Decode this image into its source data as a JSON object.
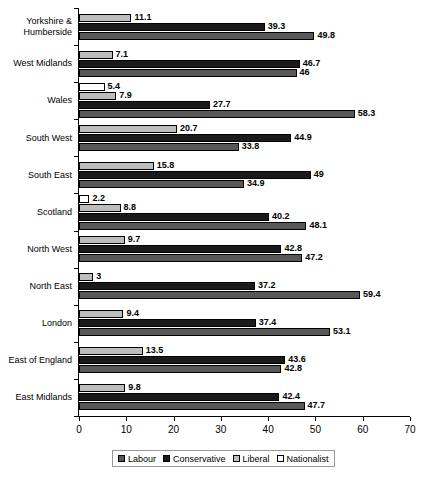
{
  "chart_data": {
    "type": "bar",
    "orientation": "horizontal",
    "title": "",
    "subtitle": "",
    "xlabel": "",
    "ylabel": "",
    "xlim": [
      0,
      70
    ],
    "xticks": [
      0,
      10,
      20,
      30,
      40,
      50,
      60,
      70
    ],
    "grid": false,
    "legend_position": "bottom",
    "series_order_top_to_bottom": [
      "Nationalist",
      "Liberal",
      "Conservative",
      "Labour"
    ],
    "categories": [
      "Yorkshire & Humberside",
      "West Midlands",
      "Wales",
      "South West",
      "South East",
      "Scotland",
      "North West",
      "North East",
      "London",
      "East of England",
      "East Midlands"
    ],
    "series": [
      {
        "name": "Labour",
        "color": "#585858",
        "values": [
          49.8,
          46,
          58.3,
          33.8,
          34.9,
          48.1,
          47.2,
          59.4,
          53.1,
          42.8,
          47.7
        ]
      },
      {
        "name": "Conservative",
        "color": "#1a1a1a",
        "values": [
          39.3,
          46.7,
          27.7,
          44.9,
          49,
          40.2,
          42.8,
          37.2,
          37.4,
          43.6,
          42.4
        ]
      },
      {
        "name": "Liberal",
        "color": "#bdbdbd",
        "values": [
          11.1,
          7.1,
          7.9,
          20.7,
          15.8,
          8.8,
          9.7,
          3,
          9.4,
          13.5,
          9.8
        ]
      },
      {
        "name": "Nationalist",
        "color": "#ffffff",
        "values": [
          null,
          null,
          5.4,
          null,
          null,
          2.2,
          null,
          null,
          null,
          null,
          null
        ]
      }
    ],
    "groups": [
      {
        "category": "Yorkshire & Humberside",
        "label_lines": [
          "Yorkshire &",
          "Humberside"
        ],
        "bars": [
          {
            "series": "Liberal",
            "value": 11.1,
            "label": "11.1"
          },
          {
            "series": "Conservative",
            "value": 39.3,
            "label": "39.3"
          },
          {
            "series": "Labour",
            "value": 49.8,
            "label": "49.8"
          }
        ]
      },
      {
        "category": "West Midlands",
        "label_lines": [
          "West Midlands"
        ],
        "bars": [
          {
            "series": "Liberal",
            "value": 7.1,
            "label": "7.1"
          },
          {
            "series": "Conservative",
            "value": 46.7,
            "label": "46.7"
          },
          {
            "series": "Labour",
            "value": 46,
            "label": "46"
          }
        ]
      },
      {
        "category": "Wales",
        "label_lines": [
          "Wales"
        ],
        "bars": [
          {
            "series": "Nationalist",
            "value": 5.4,
            "label": "5.4"
          },
          {
            "series": "Liberal",
            "value": 7.9,
            "label": "7.9"
          },
          {
            "series": "Conservative",
            "value": 27.7,
            "label": "27.7"
          },
          {
            "series": "Labour",
            "value": 58.3,
            "label": "58.3"
          }
        ]
      },
      {
        "category": "South West",
        "label_lines": [
          "South West"
        ],
        "bars": [
          {
            "series": "Liberal",
            "value": 20.7,
            "label": "20.7"
          },
          {
            "series": "Conservative",
            "value": 44.9,
            "label": "44.9"
          },
          {
            "series": "Labour",
            "value": 33.8,
            "label": "33.8"
          }
        ]
      },
      {
        "category": "South East",
        "label_lines": [
          "South East"
        ],
        "bars": [
          {
            "series": "Liberal",
            "value": 15.8,
            "label": "15.8"
          },
          {
            "series": "Conservative",
            "value": 49,
            "label": "49"
          },
          {
            "series": "Labour",
            "value": 34.9,
            "label": "34.9"
          }
        ]
      },
      {
        "category": "Scotland",
        "label_lines": [
          "Scotland"
        ],
        "bars": [
          {
            "series": "Nationalist",
            "value": 2.2,
            "label": "2.2"
          },
          {
            "series": "Liberal",
            "value": 8.8,
            "label": "8.8"
          },
          {
            "series": "Conservative",
            "value": 40.2,
            "label": "40.2"
          },
          {
            "series": "Labour",
            "value": 48.1,
            "label": "48.1"
          }
        ]
      },
      {
        "category": "North West",
        "label_lines": [
          "North West"
        ],
        "bars": [
          {
            "series": "Liberal",
            "value": 9.7,
            "label": "9.7"
          },
          {
            "series": "Conservative",
            "value": 42.8,
            "label": "42.8"
          },
          {
            "series": "Labour",
            "value": 47.2,
            "label": "47.2"
          }
        ]
      },
      {
        "category": "North East",
        "label_lines": [
          "North East"
        ],
        "bars": [
          {
            "series": "Liberal",
            "value": 3,
            "label": "3"
          },
          {
            "series": "Conservative",
            "value": 37.2,
            "label": "37.2"
          },
          {
            "series": "Labour",
            "value": 59.4,
            "label": "59.4"
          }
        ]
      },
      {
        "category": "London",
        "label_lines": [
          "London"
        ],
        "bars": [
          {
            "series": "Liberal",
            "value": 9.4,
            "label": "9.4"
          },
          {
            "series": "Conservative",
            "value": 37.4,
            "label": "37.4"
          },
          {
            "series": "Labour",
            "value": 53.1,
            "label": "53.1"
          }
        ]
      },
      {
        "category": "East of England",
        "label_lines": [
          "East of England"
        ],
        "bars": [
          {
            "series": "Liberal",
            "value": 13.5,
            "label": "13.5"
          },
          {
            "series": "Conservative",
            "value": 43.6,
            "label": "43.6"
          },
          {
            "series": "Labour",
            "value": 42.8,
            "label": "42.8"
          }
        ]
      },
      {
        "category": "East Midlands",
        "label_lines": [
          "East Midlands"
        ],
        "bars": [
          {
            "series": "Liberal",
            "value": 9.8,
            "label": "9.8"
          },
          {
            "series": "Conservative",
            "value": 42.4,
            "label": "42.4"
          },
          {
            "series": "Labour",
            "value": 47.7,
            "label": "47.7"
          }
        ]
      }
    ],
    "legend": [
      {
        "label": "Labour",
        "color": "#585858"
      },
      {
        "label": "Conservative",
        "color": "#1a1a1a"
      },
      {
        "label": "Liberal",
        "color": "#bdbdbd"
      },
      {
        "label": "Nationalist",
        "color": "#ffffff"
      }
    ]
  }
}
